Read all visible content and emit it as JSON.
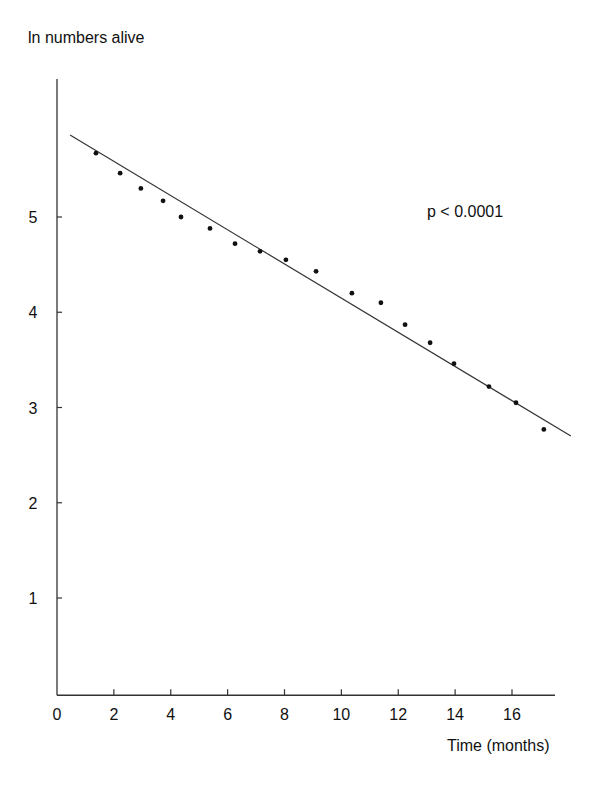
{
  "chart_data": {
    "type": "scatter",
    "title": "",
    "xlabel": "Time (months)",
    "ylabel": "ln numbers alive",
    "xlim": [
      0,
      18
    ],
    "ylim": [
      0,
      6.5
    ],
    "xticks": [
      0,
      2,
      4,
      6,
      8,
      10,
      12,
      14,
      16
    ],
    "yticks": [
      1,
      2,
      3,
      4,
      5
    ],
    "grid": false,
    "legend": null,
    "annotations": [
      {
        "text": "p < 0.0001",
        "x": 13.2,
        "y": 5.0
      }
    ],
    "series": [
      {
        "name": "observed",
        "type": "scatter",
        "x": [
          1.37,
          2.22,
          2.95,
          3.73,
          4.36,
          5.38,
          6.26,
          7.14,
          8.05,
          9.11,
          10.37,
          11.39,
          12.24,
          13.12,
          13.96,
          15.19,
          16.14,
          17.12
        ],
        "y": [
          5.67,
          5.46,
          5.3,
          5.17,
          5.0,
          4.88,
          4.72,
          4.64,
          4.55,
          4.43,
          4.2,
          4.1,
          3.87,
          3.68,
          3.46,
          3.22,
          3.05,
          2.77
        ]
      },
      {
        "name": "regression line",
        "type": "line",
        "x": [
          0.46,
          18.07
        ],
        "y": [
          5.86,
          2.7
        ]
      }
    ]
  },
  "labels": {
    "ylabel": "ln numbers alive",
    "xlabel": "Time (months)",
    "annotation": "p < 0.0001"
  },
  "colors": {
    "axis": "#333333",
    "points": "#111111",
    "line": "#333333"
  }
}
